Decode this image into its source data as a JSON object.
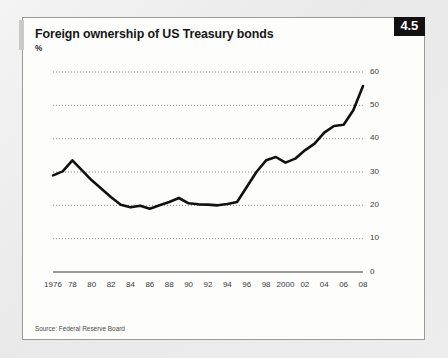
{
  "card": {
    "title": "Foreign ownership of US Treasury bonds",
    "subtitle": "%",
    "badge": "4.5",
    "source": "Source: Federal Reserve Board",
    "badge_bg": "#111111",
    "badge_fg": "#ffffff",
    "accent_color": "#c9c9c5",
    "border_color": "#9a9a96",
    "background": "#fdfdfc"
  },
  "chart_data": {
    "type": "line",
    "title": "Foreign ownership of US Treasury bonds",
    "subtitle": "%",
    "xlabel": "",
    "ylabel": "%",
    "ylim": [
      0,
      60
    ],
    "yticks": [
      0,
      10,
      20,
      30,
      40,
      50,
      60
    ],
    "ytick_labels": [
      "0",
      "10",
      "20",
      "30",
      "40",
      "50",
      "60"
    ],
    "y_axis_position": "right",
    "grid": "horizontal-dotted",
    "legend": "none",
    "line_color": "#111111",
    "line_width": 2.6,
    "xlim": [
      1976,
      2008
    ],
    "xticks": [
      1976,
      1978,
      1980,
      1982,
      1984,
      1986,
      1988,
      1990,
      1992,
      1994,
      1996,
      1998,
      2000,
      2002,
      2004,
      2006,
      2008
    ],
    "xtick_labels": [
      "1976",
      "78",
      "80",
      "82",
      "84",
      "86",
      "88",
      "90",
      "92",
      "94",
      "96",
      "98",
      "2000",
      "02",
      "04",
      "06",
      "08"
    ],
    "series": [
      {
        "name": "Foreign ownership of US Treasury bonds",
        "x": [
          1976,
          1977,
          1978,
          1979,
          1980,
          1981,
          1982,
          1983,
          1984,
          1985,
          1986,
          1987,
          1988,
          1989,
          1990,
          1991,
          1992,
          1993,
          1994,
          1995,
          1996,
          1997,
          1998,
          1999,
          2000,
          2001,
          2002,
          2003,
          2004,
          2005,
          2006,
          2007,
          2008
        ],
        "values": [
          29.0,
          30.2,
          33.5,
          30.5,
          27.5,
          25.0,
          22.4,
          20.2,
          19.4,
          19.9,
          19.0,
          20.0,
          21.0,
          22.2,
          20.6,
          20.3,
          20.2,
          20.0,
          20.4,
          21.0,
          25.5,
          30.0,
          33.5,
          34.5,
          32.8,
          34.0,
          36.5,
          38.5,
          41.8,
          43.8,
          44.2,
          48.5,
          55.8
        ]
      }
    ]
  }
}
